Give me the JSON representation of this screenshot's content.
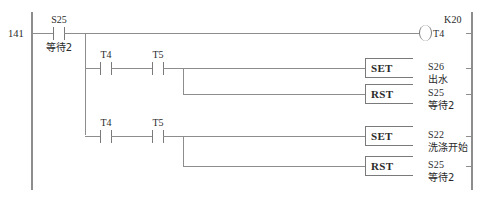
{
  "diagram": {
    "type": "plc-ladder-logic",
    "step_number": "141",
    "rails": {
      "left": "left-power-rail",
      "right": "right-power-rail"
    }
  },
  "rung_main": {
    "contact": {
      "operand": "S25",
      "comment": "等待2",
      "type": "normally-open"
    },
    "coil": {
      "operand": "T4",
      "preset": "K20",
      "type": "timer-coil"
    }
  },
  "branch_1": {
    "contacts": [
      {
        "operand": "T4",
        "type": "normally-open"
      },
      {
        "operand": "T5",
        "type": "normally-open"
      }
    ],
    "outputs": [
      {
        "instruction": "SET",
        "operand": "S26",
        "comment": "出水"
      },
      {
        "instruction": "RST",
        "operand": "S25",
        "comment": "等待2"
      }
    ]
  },
  "branch_2": {
    "contacts": [
      {
        "operand": "T4",
        "type": "normally-open"
      },
      {
        "operand": "T5",
        "type": "normally-open"
      }
    ],
    "outputs": [
      {
        "instruction": "SET",
        "operand": "S22",
        "comment": "洗涤开始"
      },
      {
        "instruction": "RST",
        "operand": "S25",
        "comment": "等待2"
      }
    ]
  },
  "colors": {
    "wire": "#8d8d8d",
    "text": "#2b2b2b"
  }
}
